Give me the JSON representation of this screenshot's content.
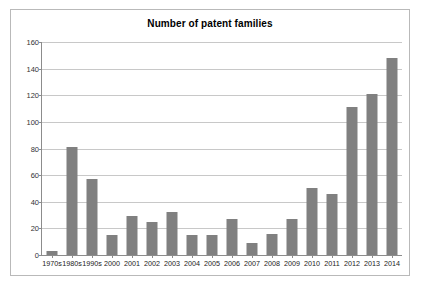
{
  "chart_data": {
    "type": "bar",
    "title": "Number of patent families",
    "xlabel": "",
    "ylabel": "",
    "ylim": [
      0,
      160
    ],
    "ytick_step": 20,
    "yticks": [
      "0",
      "20",
      "40",
      "60",
      "80",
      "100",
      "120",
      "140",
      "160"
    ],
    "grid": true,
    "legend": "none",
    "bar_color": "#808080",
    "categories": [
      "1970s",
      "1980s",
      "1990s",
      "2000",
      "2001",
      "2002",
      "2003",
      "2004",
      "2005",
      "2006",
      "2007",
      "2008",
      "2009",
      "2010",
      "2011",
      "2012",
      "2013",
      "2014"
    ],
    "values": [
      3,
      81,
      57,
      15,
      29,
      25,
      32,
      15,
      15,
      27,
      9,
      16,
      27,
      50,
      46,
      111,
      121,
      148
    ]
  }
}
